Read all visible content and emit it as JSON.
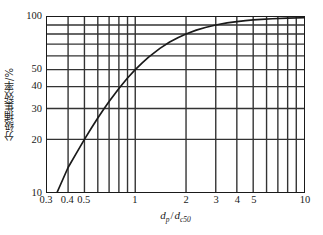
{
  "chart_data": {
    "type": "line",
    "title": "",
    "xlabel": "d_p / d_c50",
    "ylabel": "分级捕集效率/%",
    "xscale": "log",
    "yscale": "log",
    "xlim": [
      0.3,
      10
    ],
    "ylim": [
      10,
      100
    ],
    "grid": true,
    "legend": null,
    "x_ticks_labeled": [
      "0.3",
      "0.4",
      "0.5",
      "1",
      "2",
      "3",
      "4",
      "5",
      "10"
    ],
    "x_tick_values": [
      0.3,
      0.4,
      0.5,
      1,
      2,
      3,
      4,
      5,
      10
    ],
    "x_gridlines": [
      0.3,
      0.4,
      0.5,
      0.6,
      0.7,
      0.8,
      0.9,
      1,
      2,
      3,
      4,
      5,
      6,
      7,
      8,
      9,
      10
    ],
    "y_ticks_labeled": [
      "10",
      "20",
      "30",
      "40",
      "50",
      "100"
    ],
    "y_tick_values": [
      10,
      20,
      30,
      40,
      50,
      100
    ],
    "y_gridlines": [
      10,
      20,
      30,
      40,
      50,
      60,
      70,
      80,
      90,
      100
    ],
    "series": [
      {
        "name": "grade-efficiency",
        "x": [
          0.345,
          0.4,
          0.45,
          0.5,
          0.55,
          0.6,
          0.65,
          0.7,
          0.8,
          0.9,
          1.0,
          1.1,
          1.2,
          1.4,
          1.6,
          1.8,
          2.0,
          2.3,
          2.6,
          3.0,
          3.5,
          4.0,
          4.5,
          5.0,
          5.6,
          6.5,
          8.0,
          10.0
        ],
        "y": [
          10.0,
          13.8,
          16.8,
          20.0,
          23.2,
          26.5,
          29.7,
          32.9,
          39.0,
          44.8,
          50.0,
          54.7,
          59.0,
          66.2,
          71.9,
          76.4,
          80.0,
          84.1,
          87.1,
          90.0,
          92.5,
          94.1,
          95.3,
          96.2,
          96.9,
          97.7,
          98.5,
          99.0
        ]
      }
    ]
  },
  "axes": {
    "x_title_num": "d",
    "x_title_num_sub": "p",
    "x_title_slash": "/",
    "x_title_den": "d",
    "x_title_den_sub": "c50",
    "y_title": "分级捕集效率/%"
  },
  "ticks": {
    "x": [
      {
        "label": "0.3",
        "value": 0.3
      },
      {
        "label": "0.4",
        "value": 0.4
      },
      {
        "label": "0.5",
        "value": 0.5
      },
      {
        "label": "1",
        "value": 1
      },
      {
        "label": "2",
        "value": 2
      },
      {
        "label": "3",
        "value": 3
      },
      {
        "label": "4",
        "value": 4
      },
      {
        "label": "5",
        "value": 5
      },
      {
        "label": "10",
        "value": 10
      }
    ],
    "y": [
      {
        "label": "10",
        "value": 10
      },
      {
        "label": "20",
        "value": 20
      },
      {
        "label": "30",
        "value": 30
      },
      {
        "label": "40",
        "value": 40
      },
      {
        "label": "50",
        "value": 50
      },
      {
        "label": "100",
        "value": 100
      }
    ]
  },
  "style": {
    "line_color": "#1a1a1a",
    "grid_color": "#333333",
    "frame_color": "#1a1a1a",
    "background": "#ffffff"
  }
}
